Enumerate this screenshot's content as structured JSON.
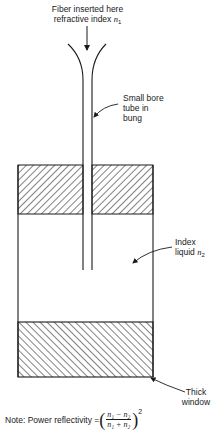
{
  "labels": {
    "fiber": {
      "line1": "Fiber inserted here",
      "line2": "refractive index ",
      "symbol": "n",
      "sub": "1"
    },
    "tube": {
      "line1": "Small bore",
      "line2": "tube in",
      "line3": "bung"
    },
    "liquid": {
      "line1": "Index",
      "line2": "liquid ",
      "symbol": "n",
      "sub": "2"
    },
    "window": {
      "line1": "Thick",
      "line2": "window"
    }
  },
  "note": {
    "prefix": "Note: Power reflectivity = ",
    "numerator": "n₁ − n₂",
    "denominator": "n₁ + n₂",
    "exponent": "2"
  },
  "colors": {
    "ink": "#1a1a1a",
    "background": "#ffffff"
  }
}
